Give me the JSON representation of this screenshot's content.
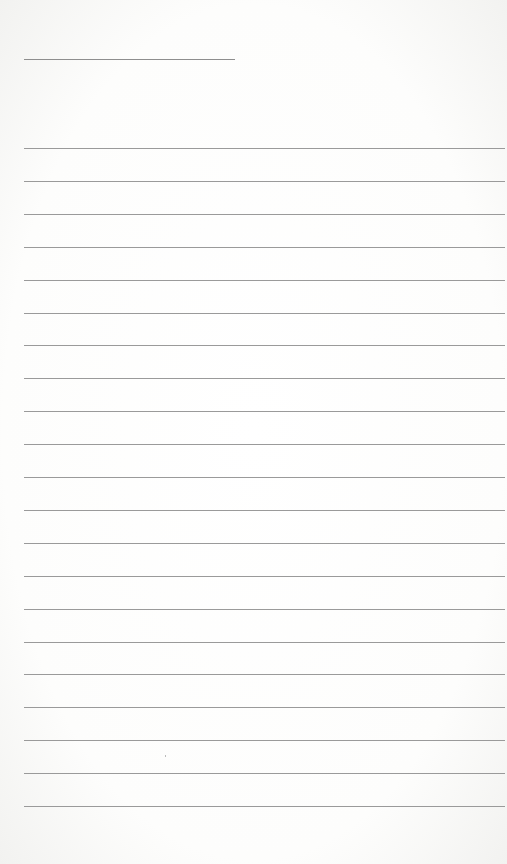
{
  "page": {
    "type": "blank lined writing paper",
    "header_line": {
      "present": true
    },
    "ruled_lines_count": 21,
    "line_color": "#9a9a9a",
    "background_color": "#ffffff",
    "text": ""
  }
}
